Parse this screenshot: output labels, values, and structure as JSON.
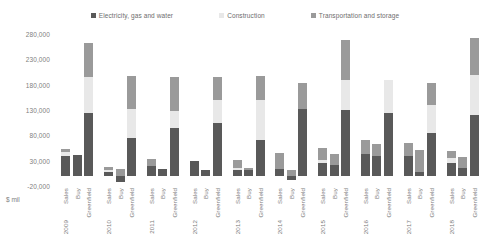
{
  "chart_data": {
    "type": "bar",
    "subtype": "stacked-grouped-column",
    "title": "",
    "xlabel": "",
    "ylabel": "$ mil",
    "unit_label": "$ mil",
    "ylim": [
      -20000,
      280000
    ],
    "ytick_values": [
      280000,
      230000,
      180000,
      130000,
      80000,
      30000,
      -20000
    ],
    "ytick_labels": [
      "280,000",
      "230,000",
      "180,000",
      "130,000",
      "80,000",
      "30,000",
      "-20,000"
    ],
    "grid": false,
    "legend_position": "top-center",
    "legend": [
      {
        "name": "Electricity, gas and water",
        "color": "#595959"
      },
      {
        "name": "Construction",
        "color": "#e8e8e8"
      },
      {
        "name": "Transportation and storage",
        "color": "#9a9a9a"
      }
    ],
    "series": [
      {
        "name": "Electricity, gas and water",
        "color": "#595959"
      },
      {
        "name": "Construction",
        "color": "#e8e8e8"
      },
      {
        "name": "Transportation and storage",
        "color": "#9a9a9a"
      }
    ],
    "categories": [
      "Sales",
      "Buy",
      "Greenfield"
    ],
    "years": [
      "2009",
      "2010",
      "2011",
      "2012",
      "2013",
      "2014",
      "2015",
      "2016",
      "2017",
      "2018"
    ],
    "groups": [
      {
        "year": "2009",
        "bars": [
          {
            "category": "Sales",
            "values": {
              "Electricity, gas and water": 40000,
              "Construction": 7000,
              "Transportation and storage": 6000
            }
          },
          {
            "category": "Buy",
            "values": {
              "Electricity, gas and water": 42000,
              "Construction": 0,
              "Transportation and storage": 0
            }
          },
          {
            "category": "Greenfield",
            "values": {
              "Electricity, gas and water": 125000,
              "Construction": 70000,
              "Transportation and storage": 68000
            }
          }
        ]
      },
      {
        "year": "2010",
        "bars": [
          {
            "category": "Sales",
            "values": {
              "Electricity, gas and water": 7000,
              "Construction": 5000,
              "Transportation and storage": 6000
            }
          },
          {
            "category": "Buy",
            "values": {
              "Electricity, gas and water": -12000,
              "Construction": 0,
              "Transportation and storage": 13000
            }
          },
          {
            "category": "Greenfield",
            "values": {
              "Electricity, gas and water": 75000,
              "Construction": 57000,
              "Transportation and storage": 66000
            }
          }
        ]
      },
      {
        "year": "2011",
        "bars": [
          {
            "category": "Sales",
            "values": {
              "Electricity, gas and water": 20000,
              "Construction": 0,
              "Transportation and storage": 14000
            }
          },
          {
            "category": "Buy",
            "values": {
              "Electricity, gas and water": 14000,
              "Construction": 0,
              "Transportation and storage": 0
            }
          },
          {
            "category": "Greenfield",
            "values": {
              "Electricity, gas and water": 94000,
              "Construction": 34000,
              "Transportation and storage": 68000
            }
          }
        ]
      },
      {
        "year": "2012",
        "bars": [
          {
            "category": "Sales",
            "values": {
              "Electricity, gas and water": 30000,
              "Construction": 0,
              "Transportation and storage": 0
            }
          },
          {
            "category": "Buy",
            "values": {
              "Electricity, gas and water": 12000,
              "Construction": 0,
              "Transportation and storage": 0
            }
          },
          {
            "category": "Greenfield",
            "values": {
              "Electricity, gas and water": 105000,
              "Construction": 45000,
              "Transportation and storage": 45000
            }
          }
        ]
      },
      {
        "year": "2013",
        "bars": [
          {
            "category": "Sales",
            "values": {
              "Electricity, gas and water": 12000,
              "Construction": 4000,
              "Transportation and storage": 16000
            }
          },
          {
            "category": "Buy",
            "values": {
              "Electricity, gas and water": 12000,
              "Construction": 0,
              "Transportation and storage": 4000
            }
          },
          {
            "category": "Greenfield",
            "values": {
              "Electricity, gas and water": 70000,
              "Construction": 80000,
              "Transportation and storage": 48000
            }
          }
        ]
      },
      {
        "year": "2014",
        "bars": [
          {
            "category": "Sales",
            "values": {
              "Electricity, gas and water": 14000,
              "Construction": 0,
              "Transportation and storage": 32000
            }
          },
          {
            "category": "Buy",
            "values": {
              "Electricity, gas and water": -8000,
              "Construction": 0,
              "Transportation and storage": 12000
            }
          },
          {
            "category": "Greenfield",
            "values": {
              "Electricity, gas and water": 132000,
              "Construction": 0,
              "Transportation and storage": 52000
            }
          }
        ]
      },
      {
        "year": "2015",
        "bars": [
          {
            "category": "Sales",
            "values": {
              "Electricity, gas and water": 26000,
              "Construction": 6000,
              "Transportation and storage": 24000
            }
          },
          {
            "category": "Buy",
            "values": {
              "Electricity, gas and water": 22000,
              "Construction": 0,
              "Transportation and storage": 22000
            }
          },
          {
            "category": "Greenfield",
            "values": {
              "Electricity, gas and water": 130000,
              "Construction": 60000,
              "Transportation and storage": 78000
            }
          }
        ]
      },
      {
        "year": "2016",
        "bars": [
          {
            "category": "Sales",
            "values": {
              "Electricity, gas and water": 44000,
              "Construction": 0,
              "Transportation and storage": 26000
            }
          },
          {
            "category": "Buy",
            "values": {
              "Electricity, gas and water": 40000,
              "Construction": 0,
              "Transportation and storage": 22000
            }
          },
          {
            "category": "Greenfield",
            "values": {
              "Electricity, gas and water": 124000,
              "Construction": 66000,
              "Transportation and storage": 0
            }
          }
        ]
      },
      {
        "year": "2017",
        "bars": [
          {
            "category": "Sales",
            "values": {
              "Electricity, gas and water": 40000,
              "Construction": 0,
              "Transportation and storage": 24000
            }
          },
          {
            "category": "Buy",
            "values": {
              "Electricity, gas and water": 8000,
              "Construction": 0,
              "Transportation and storage": 44000
            }
          },
          {
            "category": "Greenfield",
            "values": {
              "Electricity, gas and water": 84000,
              "Construction": 56000,
              "Transportation and storage": 44000
            }
          }
        ]
      },
      {
        "year": "2018",
        "bars": [
          {
            "category": "Sales",
            "values": {
              "Electricity, gas and water": 26000,
              "Construction": 9000,
              "Transportation and storage": 14000
            }
          },
          {
            "category": "Buy",
            "values": {
              "Electricity, gas and water": 16000,
              "Construction": 0,
              "Transportation and storage": 22000
            }
          },
          {
            "category": "Greenfield",
            "values": {
              "Electricity, gas and water": 120000,
              "Construction": 80000,
              "Transportation and storage": 72000
            }
          }
        ]
      }
    ]
  }
}
